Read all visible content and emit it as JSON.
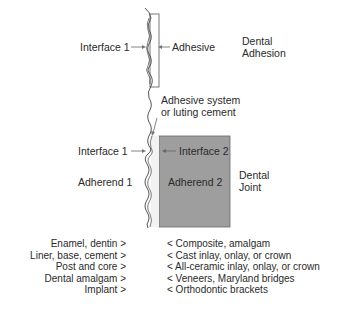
{
  "diagram": {
    "top_section": {
      "interface1_label": "Interface 1",
      "adhesive_label": "Adhesive",
      "title_line1": "Dental",
      "title_line2": "Adhesion"
    },
    "middle": {
      "adhesive_system_line1": "Adhesive system",
      "adhesive_system_line2": "or luting cement"
    },
    "bottom_section": {
      "interface1_label": "Interface 1",
      "interface2_label": "Interface 2",
      "adherend1_label": "Adherend 1",
      "adherend2_label": "Adherend 2",
      "title_line1": "Dental",
      "title_line2": "Joint"
    },
    "colors": {
      "adherend2_fill": "#9e9e9e",
      "line": "#444444",
      "arrow": "#777777"
    }
  },
  "pairs": {
    "rows": [
      {
        "adherend1": "Enamel, dentin >",
        "adherend2": "< Composite, amalgam"
      },
      {
        "adherend1": "Liner, base, cement >",
        "adherend2": "< Cast inlay, onlay, or crown"
      },
      {
        "adherend1": "Post and core >",
        "adherend2": "< All-ceramic inlay, onlay, or crown"
      },
      {
        "adherend1": "Dental amalgam >",
        "adherend2": "< Veneers, Maryland bridges"
      },
      {
        "adherend1": "Implant >",
        "adherend2": "< Orthodontic brackets"
      }
    ]
  }
}
